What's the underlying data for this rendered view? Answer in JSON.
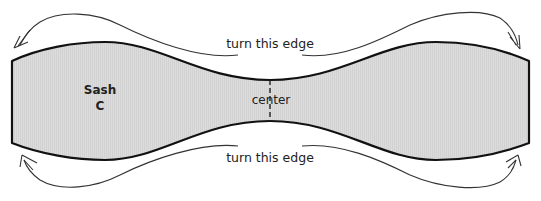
{
  "diagram": {
    "shape": {
      "name": "Sash",
      "letter": "C",
      "fill": "#d9d9d9",
      "stroke": "#111111"
    },
    "labels": {
      "top_edge": "turn this edge",
      "bottom_edge": "turn this edge",
      "center": "center",
      "sash_name": "Sash",
      "sash_letter": "C"
    },
    "arrows": [
      {
        "name": "top-left-turn-arrow",
        "direction": "down-left"
      },
      {
        "name": "top-right-turn-arrow",
        "direction": "down-right"
      },
      {
        "name": "bottom-left-turn-arrow",
        "direction": "up-left"
      },
      {
        "name": "bottom-right-turn-arrow",
        "direction": "up-right"
      }
    ],
    "line_color": "#333333",
    "center_line_color": "#222222"
  }
}
